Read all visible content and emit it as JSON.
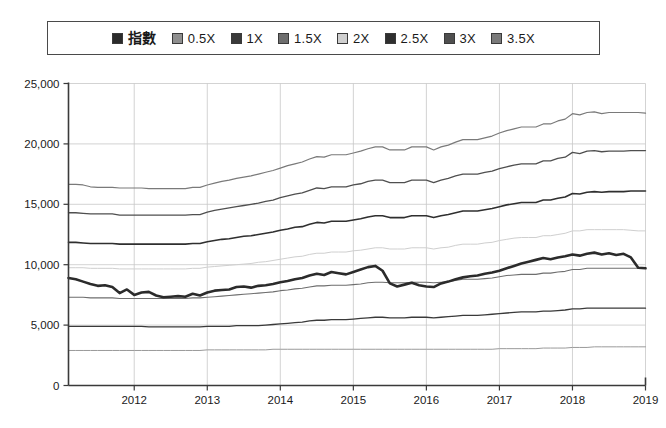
{
  "legend": {
    "position": "top-center",
    "border_color": "#4a4a4a",
    "items": [
      {
        "label": "指數",
        "color": "#2b2b2b",
        "key": "index"
      },
      {
        "label": "0.5X",
        "color": "#8f8f8f",
        "key": "x05"
      },
      {
        "label": "1X",
        "color": "#3a3a3a",
        "key": "x10"
      },
      {
        "label": "1.5X",
        "color": "#6e6e6e",
        "key": "x15"
      },
      {
        "label": "2X",
        "color": "#cfcfcf",
        "key": "x20"
      },
      {
        "label": "2.5X",
        "color": "#2f2f2f",
        "key": "x25"
      },
      {
        "label": "3X",
        "color": "#4f4f4f",
        "key": "x30"
      },
      {
        "label": "3.5X",
        "color": "#7a7a7a",
        "key": "x35"
      }
    ]
  },
  "axes": {
    "y_ticks": [
      "0",
      "5,000",
      "10,000",
      "15,000",
      "20,000",
      "25,000"
    ],
    "x_ticks": [
      "2012",
      "2013",
      "2014",
      "2015",
      "2016",
      "2017",
      "2018",
      "2019"
    ],
    "axis_color": "#3a3a3a",
    "grid_color": "#c8c8c8"
  },
  "chart_data": {
    "type": "line",
    "title": "",
    "subtitle": "",
    "xlabel": "",
    "ylabel": "",
    "xlim": [
      2011.1,
      2019.0
    ],
    "ylim": [
      0,
      25000
    ],
    "grid": true,
    "legend_position": "top-center",
    "x": [
      2011.1,
      2011.2,
      2011.3,
      2011.4,
      2011.5,
      2011.6,
      2011.7,
      2011.8,
      2011.9,
      2012.0,
      2012.1,
      2012.2,
      2012.3,
      2012.4,
      2012.5,
      2012.6,
      2012.7,
      2012.8,
      2012.9,
      2013.0,
      2013.1,
      2013.2,
      2013.3,
      2013.4,
      2013.5,
      2013.6,
      2013.7,
      2013.8,
      2013.9,
      2014.0,
      2014.1,
      2014.2,
      2014.3,
      2014.4,
      2014.5,
      2014.6,
      2014.7,
      2014.8,
      2014.9,
      2015.0,
      2015.1,
      2015.2,
      2015.3,
      2015.4,
      2015.5,
      2015.6,
      2015.7,
      2015.8,
      2015.9,
      2016.0,
      2016.1,
      2016.2,
      2016.3,
      2016.4,
      2016.5,
      2016.6,
      2016.7,
      2016.8,
      2016.9,
      2017.0,
      2017.1,
      2017.2,
      2017.3,
      2017.4,
      2017.5,
      2017.6,
      2017.7,
      2017.8,
      2017.9,
      2018.0,
      2018.1,
      2018.2,
      2018.3,
      2018.4,
      2018.5,
      2018.6,
      2018.7,
      2018.8,
      2018.9,
      2019.0
    ],
    "series": [
      {
        "name": "指數",
        "color": "#2b2b2b",
        "width": 2.6,
        "values": [
          8900,
          8800,
          8600,
          8400,
          8250,
          8300,
          8150,
          7650,
          7950,
          7500,
          7700,
          7750,
          7450,
          7300,
          7350,
          7400,
          7350,
          7600,
          7450,
          7700,
          7850,
          7900,
          7950,
          8150,
          8200,
          8100,
          8250,
          8300,
          8400,
          8550,
          8650,
          8800,
          8900,
          9100,
          9250,
          9150,
          9400,
          9300,
          9200,
          9400,
          9600,
          9800,
          9900,
          9500,
          8450,
          8200,
          8350,
          8500,
          8300,
          8200,
          8150,
          8450,
          8600,
          8800,
          8950,
          9050,
          9100,
          9250,
          9350,
          9500,
          9700,
          9900,
          10100,
          10250,
          10400,
          10550,
          10450,
          10600,
          10700,
          10850,
          10750,
          10900,
          11000,
          10850,
          10950,
          10800,
          10900,
          10600,
          9750,
          9700
        ]
      },
      {
        "name": "0.5X",
        "color": "#9a9a9a",
        "width": 1.0,
        "values": [
          2900,
          2900,
          2900,
          2900,
          2900,
          2900,
          2900,
          2900,
          2900,
          2900,
          2900,
          2900,
          2900,
          2900,
          2900,
          2900,
          2900,
          2900,
          2900,
          2950,
          2950,
          2950,
          2950,
          2950,
          2950,
          2950,
          2950,
          2950,
          3000,
          3000,
          3000,
          3000,
          3000,
          3000,
          3000,
          3000,
          3000,
          3000,
          3000,
          3000,
          3000,
          3000,
          3000,
          3000,
          3000,
          3000,
          3000,
          3000,
          3000,
          3000,
          3000,
          3000,
          3000,
          3000,
          3000,
          3000,
          3000,
          3000,
          3000,
          3050,
          3050,
          3050,
          3050,
          3050,
          3050,
          3100,
          3100,
          3100,
          3100,
          3150,
          3150,
          3150,
          3200,
          3200,
          3200,
          3200,
          3200,
          3200,
          3200,
          3200
        ]
      },
      {
        "name": "1X",
        "color": "#3a3a3a",
        "width": 1.3,
        "values": [
          4900,
          4900,
          4900,
          4900,
          4900,
          4900,
          4900,
          4900,
          4900,
          4900,
          4900,
          4850,
          4850,
          4850,
          4850,
          4850,
          4850,
          4850,
          4850,
          4900,
          4900,
          4900,
          4900,
          4950,
          4950,
          4950,
          4950,
          5000,
          5050,
          5100,
          5150,
          5200,
          5250,
          5350,
          5400,
          5400,
          5450,
          5450,
          5450,
          5500,
          5550,
          5600,
          5650,
          5650,
          5600,
          5600,
          5600,
          5650,
          5650,
          5650,
          5600,
          5650,
          5700,
          5750,
          5800,
          5800,
          5800,
          5850,
          5900,
          5950,
          6000,
          6050,
          6100,
          6100,
          6100,
          6150,
          6150,
          6200,
          6250,
          6350,
          6350,
          6400,
          6400,
          6400,
          6400,
          6400,
          6400,
          6400,
          6400,
          6400
        ]
      },
      {
        "name": "1.5X",
        "color": "#6e6e6e",
        "width": 1.1,
        "values": [
          7300,
          7300,
          7300,
          7250,
          7250,
          7250,
          7250,
          7200,
          7200,
          7200,
          7200,
          7200,
          7200,
          7200,
          7200,
          7200,
          7200,
          7250,
          7250,
          7300,
          7350,
          7400,
          7450,
          7500,
          7550,
          7600,
          7650,
          7700,
          7750,
          7850,
          7900,
          8000,
          8050,
          8150,
          8250,
          8250,
          8300,
          8300,
          8300,
          8350,
          8400,
          8500,
          8550,
          8550,
          8500,
          8500,
          8500,
          8550,
          8550,
          8550,
          8500,
          8550,
          8600,
          8700,
          8800,
          8800,
          8800,
          8850,
          8900,
          9000,
          9100,
          9150,
          9200,
          9200,
          9200,
          9300,
          9300,
          9400,
          9450,
          9600,
          9600,
          9700,
          9700,
          9700,
          9700,
          9700,
          9700,
          9700,
          9700,
          9700
        ]
      },
      {
        "name": "2X",
        "color": "#cfcfcf",
        "width": 1.0,
        "values": [
          9750,
          9750,
          9750,
          9700,
          9700,
          9700,
          9700,
          9650,
          9650,
          9650,
          9650,
          9650,
          9650,
          9650,
          9650,
          9650,
          9650,
          9700,
          9700,
          9800,
          9850,
          9900,
          9950,
          10000,
          10050,
          10100,
          10200,
          10250,
          10350,
          10450,
          10550,
          10650,
          10700,
          10850,
          10950,
          10950,
          11050,
          11050,
          11050,
          11150,
          11200,
          11300,
          11400,
          11400,
          11300,
          11300,
          11300,
          11400,
          11400,
          11400,
          11300,
          11400,
          11450,
          11600,
          11700,
          11700,
          11700,
          11800,
          11850,
          12000,
          12100,
          12200,
          12250,
          12250,
          12250,
          12400,
          12400,
          12500,
          12600,
          12800,
          12800,
          12900,
          12900,
          12900,
          12900,
          12900,
          12900,
          12850,
          12800,
          12800
        ]
      },
      {
        "name": "2.5X",
        "color": "#2f2f2f",
        "width": 1.6,
        "values": [
          11850,
          11850,
          11800,
          11750,
          11750,
          11750,
          11750,
          11700,
          11700,
          11700,
          11700,
          11700,
          11700,
          11700,
          11700,
          11700,
          11700,
          11750,
          11750,
          11900,
          12000,
          12100,
          12150,
          12250,
          12350,
          12400,
          12500,
          12600,
          12700,
          12850,
          12950,
          13100,
          13150,
          13350,
          13500,
          13450,
          13600,
          13600,
          13600,
          13700,
          13800,
          13950,
          14050,
          14050,
          13900,
          13900,
          13900,
          14050,
          14050,
          14050,
          13900,
          14050,
          14150,
          14300,
          14450,
          14450,
          14450,
          14550,
          14650,
          14800,
          14950,
          15050,
          15150,
          15150,
          15150,
          15350,
          15350,
          15500,
          15600,
          15900,
          15850,
          16000,
          16050,
          16000,
          16050,
          16050,
          16050,
          16100,
          16100,
          16100
        ]
      },
      {
        "name": "3X",
        "color": "#4f4f4f",
        "width": 1.3,
        "values": [
          14300,
          14300,
          14250,
          14200,
          14200,
          14200,
          14200,
          14100,
          14100,
          14100,
          14100,
          14100,
          14100,
          14100,
          14100,
          14100,
          14100,
          14150,
          14150,
          14350,
          14500,
          14600,
          14700,
          14800,
          14900,
          15000,
          15100,
          15250,
          15350,
          15550,
          15700,
          15850,
          15950,
          16150,
          16350,
          16300,
          16450,
          16450,
          16450,
          16600,
          16700,
          16900,
          17000,
          17000,
          16800,
          16800,
          16800,
          17000,
          17000,
          17000,
          16800,
          17000,
          17150,
          17350,
          17500,
          17500,
          17500,
          17650,
          17750,
          17950,
          18100,
          18250,
          18350,
          18350,
          18350,
          18600,
          18600,
          18800,
          18900,
          19300,
          19200,
          19400,
          19450,
          19350,
          19400,
          19400,
          19400,
          19450,
          19450,
          19450
        ]
      },
      {
        "name": "3.5X",
        "color": "#7a7a7a",
        "width": 1.2,
        "values": [
          16650,
          16650,
          16600,
          16450,
          16400,
          16400,
          16400,
          16350,
          16350,
          16350,
          16350,
          16300,
          16300,
          16300,
          16300,
          16300,
          16300,
          16400,
          16400,
          16600,
          16750,
          16900,
          17000,
          17150,
          17250,
          17350,
          17500,
          17650,
          17800,
          18000,
          18200,
          18350,
          18500,
          18750,
          18950,
          18900,
          19100,
          19100,
          19100,
          19250,
          19400,
          19600,
          19750,
          19750,
          19500,
          19500,
          19500,
          19750,
          19750,
          19750,
          19500,
          19750,
          19900,
          20150,
          20350,
          20350,
          20350,
          20500,
          20650,
          20900,
          21100,
          21250,
          21400,
          21400,
          21400,
          21650,
          21650,
          21900,
          22050,
          22500,
          22400,
          22600,
          22650,
          22500,
          22600,
          22600,
          22600,
          22600,
          22600,
          22550
        ]
      }
    ]
  }
}
